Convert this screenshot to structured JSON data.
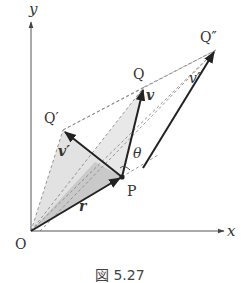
{
  "figure": {
    "caption": "図 5.27",
    "axes": {
      "x_label": "x",
      "y_label": "y",
      "origin_label": "O"
    },
    "points": {
      "P": "P",
      "Q": "Q",
      "Q_prime": "Q′",
      "Q_double_prime": "Q″"
    },
    "vectors": {
      "r": "r",
      "v": "v",
      "v_prime": "v′",
      "v_double_prime": "v″"
    },
    "angle": "θ",
    "colors": {
      "axis": "#555555",
      "vector": "#222222",
      "dashed": "#888888",
      "shade_light": "#e6e6e6",
      "shade_dark": "#c8c8c8"
    }
  }
}
